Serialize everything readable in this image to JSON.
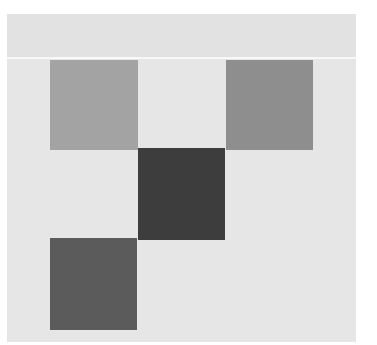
{
  "figure": {
    "background": "#e6e6e6",
    "header_band_color": "#e2e2e2",
    "divider_color": "#f8f8f8"
  },
  "squares": [
    {
      "name": "top-left-square",
      "left": 43,
      "top": 46,
      "width": 88,
      "height": 90,
      "color": "#a3a3a3"
    },
    {
      "name": "top-right-square",
      "left": 219,
      "top": 46,
      "width": 87,
      "height": 90,
      "color": "#8e8e8e"
    },
    {
      "name": "center-square",
      "left": 131,
      "top": 134,
      "width": 87,
      "height": 92,
      "color": "#3d3d3d"
    },
    {
      "name": "bottom-left-square",
      "left": 43,
      "top": 224,
      "width": 87,
      "height": 92,
      "color": "#5b5b5b"
    }
  ]
}
